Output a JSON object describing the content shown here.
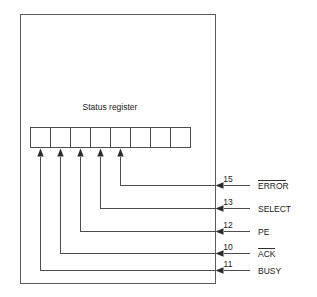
{
  "diagram": {
    "title": "Status register",
    "register": {
      "cell_count": 8,
      "cells": [
        "",
        "",
        "",
        "",
        "",
        "",
        "",
        ""
      ]
    },
    "signals": [
      {
        "pin": "15",
        "label": "ERROR",
        "active_low": true,
        "register_bit_index": 4,
        "line_y": 185
      },
      {
        "pin": "13",
        "label": "SELECT",
        "active_low": false,
        "register_bit_index": 3,
        "line_y": 208
      },
      {
        "pin": "12",
        "label": "PE",
        "active_low": false,
        "register_bit_index": 2,
        "line_y": 231
      },
      {
        "pin": "10",
        "label": "ACK",
        "active_low": true,
        "register_bit_index": 1,
        "line_y": 253
      },
      {
        "pin": "11",
        "label": "BUSY",
        "active_low": false,
        "register_bit_index": 0,
        "line_y": 270
      }
    ],
    "colors": {
      "line": "#4d4d4d",
      "outer_border": "#5a5a5a",
      "arrowhead": "#2b2b2b",
      "text": "#1a1a1a",
      "background": "#ffffff"
    }
  }
}
